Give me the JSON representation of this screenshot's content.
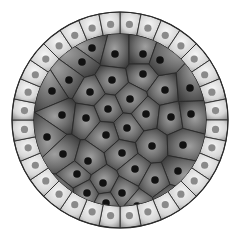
{
  "diagram": {
    "center": [
      120,
      120
    ],
    "outer_radius": 108,
    "inner_radius": 86,
    "colors": {
      "background": "#ffffff",
      "outer_cell_light": "#f2f2f2",
      "outer_cell_dark": "#9a9a9a",
      "outer_nucleus": "#8a8a8a",
      "inner_cell_light": "#8c8c8c",
      "inner_cell_dark": "#4a4a4a",
      "inner_nucleus": "#111111",
      "outline": "#2a2a2a"
    },
    "outer_ring": {
      "cell_count": 32,
      "label": ""
    },
    "inner_cells": [
      [
        92,
        48
      ],
      [
        115,
        54
      ],
      [
        143,
        54
      ],
      [
        82,
        62
      ],
      [
        112,
        80
      ],
      [
        143,
        74
      ],
      [
        69,
        80
      ],
      [
        90,
        92
      ],
      [
        130,
        99
      ],
      [
        165,
        90
      ],
      [
        52,
        91
      ],
      [
        108,
        109
      ],
      [
        62,
        115
      ],
      [
        86,
        118
      ],
      [
        146,
        114
      ],
      [
        171,
        117
      ],
      [
        191,
        114
      ],
      [
        127,
        128
      ],
      [
        47,
        137
      ],
      [
        106,
        135
      ],
      [
        152,
        146
      ],
      [
        183,
        145
      ],
      [
        63,
        154
      ],
      [
        122,
        153
      ],
      [
        88,
        161
      ],
      [
        135,
        169
      ],
      [
        77,
        174
      ],
      [
        178,
        171
      ],
      [
        155,
        180
      ],
      [
        103,
        183
      ],
      [
        122,
        193
      ],
      [
        87,
        193
      ],
      [
        106,
        203
      ],
      [
        137,
        206
      ],
      [
        190,
        88
      ],
      [
        60,
        195
      ],
      [
        160,
        60
      ],
      [
        170,
        200
      ]
    ]
  }
}
